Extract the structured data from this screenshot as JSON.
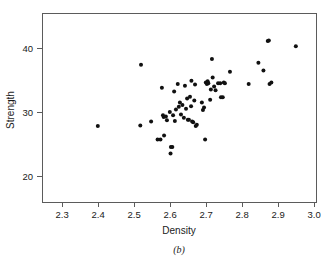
{
  "chart_data": {
    "type": "scatter",
    "title": "",
    "subtitle": "",
    "xlabel": "Density",
    "ylabel": "Strength",
    "caption": "(b)",
    "grid": false,
    "legend": null,
    "xlim": [
      2.244,
      3.005
    ],
    "ylim": [
      16.0,
      45.6
    ],
    "xticks": [
      2.3,
      2.4,
      2.5,
      2.6,
      2.7,
      2.8,
      2.9,
      3.0
    ],
    "xticklabels": [
      "2.3",
      "2.4",
      "2.5",
      "2.6",
      "2.7",
      "2.8",
      "2.9",
      "3.0"
    ],
    "yticks": [
      20,
      30,
      40
    ],
    "yticklabels": [
      "20",
      "30",
      "40"
    ],
    "marker": "filled-circle",
    "marker_color": "#111111",
    "marker_size_px": 2.0,
    "point_count": 69,
    "points": [
      {
        "x": 2.399,
        "y": 27.9
      },
      {
        "x": 2.519,
        "y": 37.5
      },
      {
        "x": 2.517,
        "y": 28.0
      },
      {
        "x": 2.547,
        "y": 28.6
      },
      {
        "x": 2.565,
        "y": 25.8
      },
      {
        "x": 2.573,
        "y": 25.8
      },
      {
        "x": 2.577,
        "y": 33.9
      },
      {
        "x": 2.58,
        "y": 29.6
      },
      {
        "x": 2.582,
        "y": 29.3
      },
      {
        "x": 2.583,
        "y": 26.4
      },
      {
        "x": 2.588,
        "y": 29.4
      },
      {
        "x": 2.591,
        "y": 28.8
      },
      {
        "x": 2.599,
        "y": 30.1
      },
      {
        "x": 2.601,
        "y": 23.6
      },
      {
        "x": 2.602,
        "y": 24.6
      },
      {
        "x": 2.606,
        "y": 24.6
      },
      {
        "x": 2.608,
        "y": 29.6
      },
      {
        "x": 2.611,
        "y": 33.3
      },
      {
        "x": 2.613,
        "y": 28.7
      },
      {
        "x": 2.616,
        "y": 30.5
      },
      {
        "x": 2.621,
        "y": 34.5
      },
      {
        "x": 2.624,
        "y": 30.9
      },
      {
        "x": 2.627,
        "y": 31.6
      },
      {
        "x": 2.63,
        "y": 29.7
      },
      {
        "x": 2.634,
        "y": 31.2
      },
      {
        "x": 2.638,
        "y": 29.2
      },
      {
        "x": 2.641,
        "y": 34.2
      },
      {
        "x": 2.644,
        "y": 30.6
      },
      {
        "x": 2.647,
        "y": 32.2
      },
      {
        "x": 2.649,
        "y": 28.9
      },
      {
        "x": 2.652,
        "y": 28.9
      },
      {
        "x": 2.655,
        "y": 32.5
      },
      {
        "x": 2.658,
        "y": 31.0
      },
      {
        "x": 2.659,
        "y": 35.0
      },
      {
        "x": 2.661,
        "y": 28.6
      },
      {
        "x": 2.664,
        "y": 28.5
      },
      {
        "x": 2.667,
        "y": 31.9
      },
      {
        "x": 2.669,
        "y": 34.4
      },
      {
        "x": 2.671,
        "y": 27.9
      },
      {
        "x": 2.674,
        "y": 28.1
      },
      {
        "x": 2.688,
        "y": 31.6
      },
      {
        "x": 2.691,
        "y": 30.4
      },
      {
        "x": 2.694,
        "y": 30.8
      },
      {
        "x": 2.697,
        "y": 25.8
      },
      {
        "x": 2.699,
        "y": 34.7
      },
      {
        "x": 2.702,
        "y": 34.5
      },
      {
        "x": 2.704,
        "y": 34.9
      },
      {
        "x": 2.706,
        "y": 34.6
      },
      {
        "x": 2.711,
        "y": 32.0
      },
      {
        "x": 2.713,
        "y": 33.6
      },
      {
        "x": 2.716,
        "y": 38.4
      },
      {
        "x": 2.718,
        "y": 35.5
      },
      {
        "x": 2.722,
        "y": 34.1
      },
      {
        "x": 2.726,
        "y": 33.5
      },
      {
        "x": 2.733,
        "y": 34.6
      },
      {
        "x": 2.739,
        "y": 34.6
      },
      {
        "x": 2.741,
        "y": 32.4
      },
      {
        "x": 2.746,
        "y": 32.4
      },
      {
        "x": 2.749,
        "y": 34.7
      },
      {
        "x": 2.752,
        "y": 34.6
      },
      {
        "x": 2.766,
        "y": 36.4
      },
      {
        "x": 2.818,
        "y": 34.5
      },
      {
        "x": 2.845,
        "y": 37.8
      },
      {
        "x": 2.859,
        "y": 36.6
      },
      {
        "x": 2.871,
        "y": 41.2
      },
      {
        "x": 2.874,
        "y": 41.3
      },
      {
        "x": 2.876,
        "y": 34.5
      },
      {
        "x": 2.881,
        "y": 34.7
      },
      {
        "x": 2.949,
        "y": 40.4
      }
    ]
  }
}
